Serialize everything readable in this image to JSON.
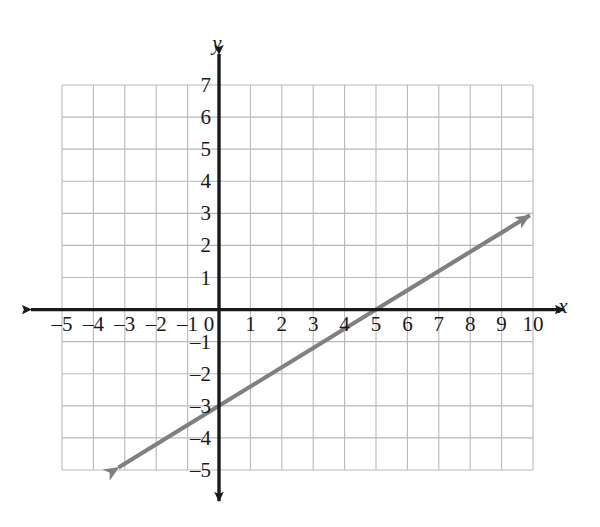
{
  "figure": {
    "background_color": "#ffffff",
    "grid_color": "#b9b9b9",
    "axis_color": "#1a1a1a",
    "line_color": "#808080",
    "label_color": "#1a1a1a"
  },
  "axis_labels": {
    "x": "x",
    "y": "y"
  },
  "chart_data": {
    "type": "line",
    "title": "",
    "subtitle": "",
    "xlabel": "x",
    "ylabel": "y",
    "xlim": [
      -5,
      10
    ],
    "ylim": [
      -5,
      7
    ],
    "grid": true,
    "grid_step": 1,
    "legend": "none",
    "x_ticks": [
      -5,
      -4,
      -3,
      -2,
      -1,
      0,
      1,
      2,
      3,
      4,
      5,
      6,
      7,
      8,
      9,
      10
    ],
    "x_tick_labels": [
      "–5",
      "–4",
      "–3",
      "–2",
      "–1",
      "0",
      "1",
      "2",
      "3",
      "4",
      "5",
      "6",
      "7",
      "8",
      "9",
      "10"
    ],
    "y_ticks": [
      7,
      6,
      5,
      4,
      3,
      2,
      1,
      -1,
      -2,
      -3,
      -4,
      -5
    ],
    "y_tick_labels": [
      "7",
      "6",
      "5",
      "4",
      "3",
      "2",
      "1",
      "–1",
      "–2",
      "–3",
      "–4",
      "–5"
    ],
    "series": [
      {
        "name": "line",
        "equation": "y = 0.6x - 3",
        "slope": 0.6,
        "y_intercept": -3,
        "x_intercept": 5,
        "color": "#808080",
        "arrow_start": true,
        "arrow_end": true,
        "points": [
          {
            "x": -3.2,
            "y": -4.92
          },
          {
            "x": 0,
            "y": -3
          },
          {
            "x": 5,
            "y": 0
          },
          {
            "x": 9.9,
            "y": 2.94
          }
        ]
      }
    ],
    "annotations": []
  }
}
